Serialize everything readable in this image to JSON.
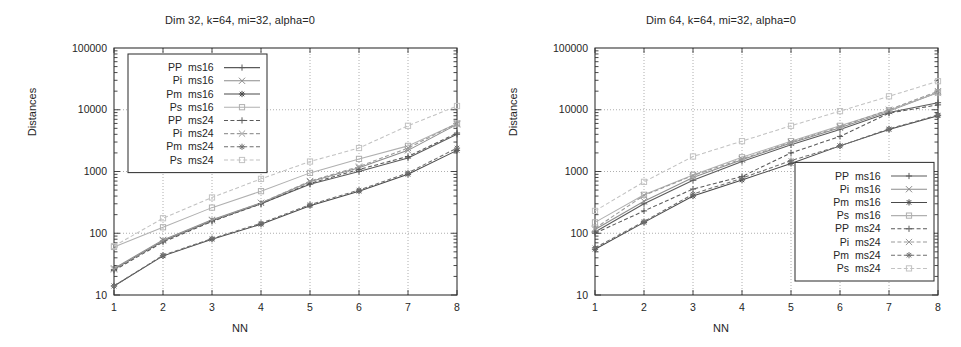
{
  "figure": {
    "width": 961,
    "height": 347,
    "background": "#ffffff",
    "ink": "#333333"
  },
  "charts": [
    {
      "id": "dim32",
      "chart_data": {
        "type": "line",
        "title": "Dim 32, k=64, mi=32, alpha=0",
        "xlabel": "NN",
        "ylabel": "Distances",
        "xscale": "linear",
        "yscale": "log",
        "xlim": [
          1,
          8
        ],
        "ylim": [
          10,
          100000
        ],
        "xticks": [
          1,
          2,
          3,
          4,
          5,
          6,
          7,
          8
        ],
        "xticklabels": [
          "1",
          "2",
          "3",
          "4",
          "5",
          "6",
          "7",
          "8"
        ],
        "yticks": [
          10,
          100,
          1000,
          10000,
          100000
        ],
        "yticklabels": [
          "10",
          "100",
          "1000",
          "10000",
          "100000"
        ],
        "grid": true,
        "legend_position": "upper-left",
        "x": [
          1,
          2,
          3,
          4,
          5,
          6,
          7,
          8
        ],
        "series": [
          {
            "name": "PP  ms16",
            "marker": "plus",
            "dash": "solid",
            "color": "#5a5a5a",
            "values": [
              26,
              75,
              160,
              300,
              620,
              1000,
              1650,
              4000
            ]
          },
          {
            "name": "Pi  ms16",
            "marker": "cross",
            "dash": "solid",
            "color": "#8c8c8c",
            "values": [
              27,
              78,
              165,
              310,
              680,
              1150,
              2200,
              5800
            ]
          },
          {
            "name": "Pm  ms16",
            "marker": "star",
            "dash": "solid",
            "color": "#4a4a4a",
            "values": [
              14,
              43,
              80,
              140,
              280,
              480,
              900,
              2200
            ]
          },
          {
            "name": "Ps  ms16",
            "marker": "square",
            "dash": "solid",
            "color": "#b0b0b0",
            "values": [
              60,
              125,
              260,
              480,
              950,
              1600,
              2600,
              6000
            ]
          },
          {
            "name": "PP  ms24",
            "marker": "plus",
            "dash": "dashed",
            "color": "#5a5a5a",
            "values": [
              25,
              72,
              155,
              300,
              640,
              1080,
              1750,
              4200
            ]
          },
          {
            "name": "Pi  ms24",
            "marker": "cross",
            "dash": "dashed",
            "color": "#9a9a9a",
            "values": [
              26,
              76,
              162,
              310,
              700,
              1200,
              2400,
              6000
            ]
          },
          {
            "name": "Pm  ms24",
            "marker": "star",
            "dash": "dashed",
            "color": "#6f6f6f",
            "values": [
              14,
              44,
              82,
              145,
              290,
              500,
              950,
              2400
            ]
          },
          {
            "name": "Ps  ms24",
            "marker": "square",
            "dash": "dashed",
            "color": "#c2c2c2",
            "values": [
              62,
              175,
              380,
              760,
              1450,
              2400,
              5500,
              11500
            ]
          }
        ]
      }
    },
    {
      "id": "dim64",
      "chart_data": {
        "type": "line",
        "title": "Dim 64, k=64, mi=32, alpha=0",
        "xlabel": "NN",
        "ylabel": "Distances",
        "xscale": "linear",
        "yscale": "log",
        "xlim": [
          1,
          8
        ],
        "ylim": [
          10,
          100000
        ],
        "xticks": [
          1,
          2,
          3,
          4,
          5,
          6,
          7,
          8
        ],
        "xticklabels": [
          "1",
          "2",
          "3",
          "4",
          "5",
          "6",
          "7",
          "8"
        ],
        "yticks": [
          10,
          100,
          1000,
          10000,
          100000
        ],
        "yticklabels": [
          "10",
          "100",
          "1000",
          "10000",
          "100000"
        ],
        "grid": true,
        "legend_position": "lower-right",
        "x": [
          1,
          2,
          3,
          4,
          5,
          6,
          7,
          8
        ],
        "series": [
          {
            "name": "PP  ms16",
            "marker": "plus",
            "dash": "solid",
            "color": "#5a5a5a",
            "values": [
              105,
              300,
              720,
              1450,
              2700,
              4800,
              9000,
              13000
            ]
          },
          {
            "name": "Pi  ms16",
            "marker": "cross",
            "dash": "solid",
            "color": "#8c8c8c",
            "values": [
              115,
              330,
              800,
              1550,
              2900,
              5100,
              9500,
              19000
            ]
          },
          {
            "name": "Pm  ms16",
            "marker": "star",
            "dash": "solid",
            "color": "#4a4a4a",
            "values": [
              55,
              150,
              400,
              730,
              1350,
              2600,
              4800,
              8000
            ]
          },
          {
            "name": "Ps  ms16",
            "marker": "square",
            "dash": "solid",
            "color": "#b0b0b0",
            "values": [
              150,
              420,
              880,
              1700,
              3100,
              5500,
              9800,
              19000
            ]
          },
          {
            "name": "PP  ms24",
            "marker": "plus",
            "dash": "dashed",
            "color": "#5a5a5a",
            "values": [
              100,
              230,
              520,
              830,
              2000,
              3700,
              8800,
              12000
            ]
          },
          {
            "name": "Pi  ms24",
            "marker": "cross",
            "dash": "dashed",
            "color": "#9a9a9a",
            "values": [
              120,
              410,
              860,
              1600,
              3000,
              5300,
              10000,
              20000
            ]
          },
          {
            "name": "Pm  ms24",
            "marker": "star",
            "dash": "dashed",
            "color": "#6f6f6f",
            "values": [
              58,
              155,
              430,
              780,
              1500,
              2600,
              4900,
              8200
            ]
          },
          {
            "name": "Ps  ms24",
            "marker": "square",
            "dash": "dashed",
            "color": "#c2c2c2",
            "values": [
              230,
              680,
              1750,
              3100,
              5500,
              9500,
              16500,
              29000
            ]
          }
        ]
      }
    }
  ]
}
